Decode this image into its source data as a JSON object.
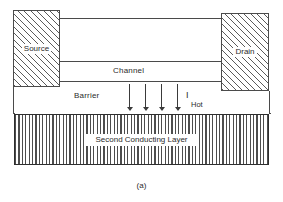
{
  "figure": {
    "caption": "(a)"
  },
  "regions": {
    "source": {
      "label": "Source",
      "hatch": "diagonal"
    },
    "drain": {
      "label": "Drain",
      "hatch": "diagonal"
    },
    "channel": {
      "label": "Channel"
    },
    "barrier": {
      "label": "Barrier"
    },
    "second_conducting_layer": {
      "label": "Second Conducting Layer",
      "hatch": "vertical"
    }
  },
  "annotations": {
    "hot_current": {
      "symbol": "I",
      "subscript": "Hot"
    },
    "injection_arrows": {
      "count": 4,
      "direction": "down"
    }
  },
  "colors": {
    "line": "#4a4a4a",
    "hatch": "#5a5a5a",
    "text": "#2b2b2b",
    "background": "#ffffff",
    "layer_border": "#2e2e2e"
  }
}
